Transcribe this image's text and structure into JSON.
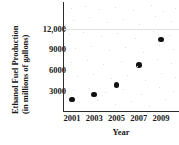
{
  "chart_data": {
    "type": "scatter",
    "title": "",
    "xlabel": "Year",
    "ylabel": "Ethanol Fuel Production (in millions of gallons)",
    "ylabel_line1": "Ethanol Fuel Production",
    "ylabel_line2": "(in millions of gallons)",
    "x": [
      2001,
      2003,
      2005,
      2007,
      2009
    ],
    "values": [
      1750,
      2500,
      3900,
      6800,
      10500
    ],
    "points": [
      {
        "x": 2001,
        "y": 1750
      },
      {
        "x": 2003,
        "y": 2500
      },
      {
        "x": 2005,
        "y": 3900
      },
      {
        "x": 2007,
        "y": 6800
      },
      {
        "x": 2009,
        "y": 10500
      }
    ],
    "xtick_labels": [
      "2001",
      "2003",
      "2005",
      "2007",
      "2009"
    ],
    "xticks": [
      2001,
      2003,
      2005,
      2007,
      2009
    ],
    "ytick_labels": [
      "3000",
      "6000",
      "9000",
      "12,000"
    ],
    "yticks": [
      3000,
      6000,
      9000,
      12000
    ],
    "xlim": [
      2000,
      2010
    ],
    "ylim": [
      0,
      13750
    ],
    "grid": false,
    "legend": null,
    "marker_color": "#111111",
    "axis_color": "#2b2b2b"
  }
}
